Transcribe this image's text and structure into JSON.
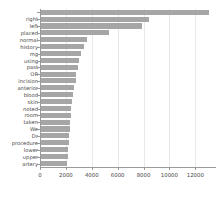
{
  "chart_data": {
    "type": "bar",
    "orientation": "horizontal",
    "title": "",
    "xlabel": "",
    "ylabel": "",
    "xlim": [
      0,
      13600
    ],
    "grid": true,
    "legend": false,
    "bar_color": "#9e9e9e",
    "background_color": "#ffffff",
    "xticks": [
      0,
      2000,
      4000,
      6000,
      8000,
      10000,
      12000
    ],
    "xticklabels": [
      "0",
      "2000",
      "4000",
      "6000",
      "8000",
      "10000",
      "12000"
    ],
    "categories": [
      "",
      "right",
      "left",
      "placed",
      "normal",
      "history",
      "mg",
      "using",
      "past",
      "OR",
      "incision",
      "anterior",
      "blood",
      "skin",
      "noted",
      "room",
      "taken",
      "We",
      "Dr",
      "procedure",
      "lower",
      "upper",
      "artery"
    ],
    "values": [
      13050,
      8400,
      7850,
      5350,
      3600,
      3400,
      3200,
      3050,
      2900,
      2800,
      2750,
      2650,
      2550,
      2480,
      2420,
      2380,
      2340,
      2300,
      2270,
      2240,
      2200,
      2160,
      2120
    ]
  }
}
